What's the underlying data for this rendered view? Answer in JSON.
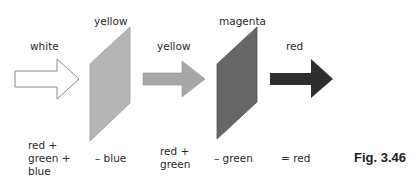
{
  "figure": {
    "caption": "Fig. 3.46",
    "top_labels": {
      "incident_light": "white",
      "filter1": "yellow",
      "light_after_filter1": "yellow",
      "filter2": "magenta",
      "light_after_filter2": "red"
    },
    "bottom_labels": {
      "incident_line1": "red +",
      "incident_line2": "green +",
      "incident_line3": "blue",
      "filter1_effect": "– blue",
      "after_filter1_line1": "red +",
      "after_filter1_line2": "green",
      "filter2_effect": "– green",
      "result": "= red"
    },
    "colors": {
      "white_arrow_fill": "#ffffff",
      "white_arrow_stroke": "#8a8a8a",
      "yellow_filter": "#b5b5b5",
      "yellow_arrow": "#a8a8a8",
      "magenta_filter": "#666666",
      "red_arrow": "#2e2e2e"
    }
  }
}
